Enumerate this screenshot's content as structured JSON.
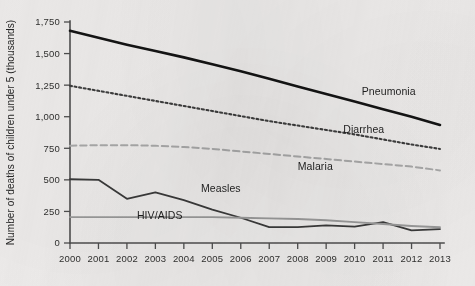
{
  "chart_data": {
    "type": "line",
    "title": "",
    "subtitle": "",
    "xlabel": "",
    "ylabel": "Number of deaths of children under 5 (thousands)",
    "x": [
      2000,
      2001,
      2002,
      2003,
      2004,
      2005,
      2006,
      2007,
      2008,
      2009,
      2010,
      2011,
      2012,
      2013
    ],
    "xtick_labels": [
      "2000",
      "2001",
      "2002",
      "2003",
      "2004",
      "2005",
      "2006",
      "2007",
      "2008",
      "2009",
      "2010",
      "2011",
      "2012",
      "2013"
    ],
    "ytick_labels": [
      "0",
      "250",
      "500",
      "750",
      "1,000",
      "1,250",
      "1,500",
      "1,750"
    ],
    "ytick_values": [
      0,
      250,
      500,
      750,
      1000,
      1250,
      1500,
      1750
    ],
    "ylim": [
      0,
      1750
    ],
    "xlim": [
      2000,
      2013
    ],
    "grid": false,
    "legend_position": "inline-labels",
    "series": [
      {
        "name": "Pneumonia",
        "label": "Pneumonia",
        "color": "#141414",
        "style": "solid",
        "width": 2.6,
        "label_x": 2010.25,
        "label_y": 1175,
        "values": [
          1680,
          1625,
          1570,
          1520,
          1470,
          1415,
          1360,
          1300,
          1240,
          1180,
          1120,
          1060,
          1000,
          935
        ]
      },
      {
        "name": "Diarrhea",
        "label": "Diarrhea",
        "color": "#3d3d3d",
        "style": "dotted",
        "width": 2.1,
        "label_x": 2009.6,
        "label_y": 875,
        "values": [
          1245,
          1205,
          1165,
          1125,
          1085,
          1045,
          1005,
          965,
          930,
          895,
          860,
          820,
          780,
          745
        ]
      },
      {
        "name": "Malaria",
        "label": "Malaria",
        "color": "#a9a9a9",
        "style": "dashed",
        "width": 2.0,
        "label_x": 2008.0,
        "label_y": 575,
        "values": [
          770,
          775,
          775,
          770,
          760,
          745,
          725,
          705,
          685,
          665,
          645,
          625,
          605,
          575
        ]
      },
      {
        "name": "Measles",
        "label": "Measles",
        "color": "#3a3a3a",
        "style": "solid",
        "width": 1.8,
        "label_x": 2004.6,
        "label_y": 400,
        "values": [
          505,
          500,
          350,
          400,
          340,
          265,
          200,
          125,
          125,
          140,
          130,
          165,
          100,
          110
        ]
      },
      {
        "name": "HIV/AIDS",
        "label": "HIV/AIDS",
        "color": "#9a9a9a",
        "style": "solid",
        "width": 1.9,
        "label_x": 2002.35,
        "label_y": 190,
        "values": [
          205,
          205,
          205,
          205,
          205,
          205,
          200,
          195,
          190,
          180,
          165,
          150,
          135,
          125
        ]
      }
    ]
  },
  "layout": {
    "plot_left": 70,
    "plot_right": 440,
    "plot_top": 22,
    "plot_bottom": 243
  },
  "colors": {
    "background": "#eeeceb",
    "axis": "#4e4e4e",
    "text": "#2b2b2b"
  }
}
